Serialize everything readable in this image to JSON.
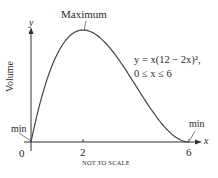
{
  "chart_data": {
    "type": "line",
    "title": "",
    "xlabel": "x",
    "ylabel": "y",
    "y_axis_title": "Volume",
    "equation_line1": "y = x(12 − 2x)²,",
    "equation_line2": "0 ≤ x ≤ 6",
    "annotations": {
      "maximum": "Maximum",
      "min_left": "min",
      "min_right": "min",
      "note": "NOT TO SCALE"
    },
    "x_ticks": [
      "0",
      "2",
      "6"
    ],
    "xlim": [
      0,
      6
    ],
    "ylim": [
      0,
      128
    ],
    "grid": false,
    "series": [
      {
        "name": "y = x(12 - 2x)^2",
        "x": [
          0,
          0.5,
          1,
          1.5,
          2,
          2.5,
          3,
          3.5,
          4,
          4.5,
          5,
          5.5,
          6
        ],
        "values": [
          0,
          60.5,
          100,
          121.5,
          128,
          122.5,
          108,
          87.5,
          64,
          40.5,
          20,
          5.5,
          0
        ]
      }
    ],
    "key_points": {
      "maximum": {
        "x": 2,
        "y": 128
      },
      "min_left": {
        "x": 0,
        "y": 0
      },
      "min_right": {
        "x": 6,
        "y": 0
      }
    }
  }
}
